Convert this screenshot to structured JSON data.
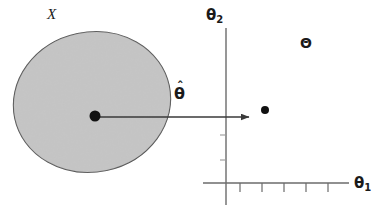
{
  "figure": {
    "kind": "statistical-diagram",
    "background_color": "#ffffff",
    "width": 386,
    "height": 215
  },
  "labels": {
    "sample_space": "X",
    "estimator": "θ",
    "estimator_hat": "ˆ",
    "parameter_space": "Θ",
    "y_axis": "θ",
    "y_axis_subscript": "2",
    "x_axis": "θ",
    "x_axis_subscript": "1"
  },
  "colors": {
    "region_fill": "#c9c9c9",
    "region_stroke": "#4d4d4d",
    "axis": "#6b6b6b",
    "arrow": "#3a3a3a",
    "dot": "#111111",
    "text": "#1a1a1a"
  },
  "shapes": {
    "sample_region": {
      "name": "ellipse",
      "center_x": 92,
      "center_y": 102,
      "radius_x": 79,
      "radius_y": 70,
      "rotation_deg": -12
    },
    "true_parameter_dot": {
      "cx": 95,
      "cy": 116,
      "r": 5.5
    },
    "estimate_dot": {
      "cx": 265,
      "cy": 110,
      "r": 4
    },
    "mapping_arrow": {
      "x1": 98,
      "y1": 117,
      "x2": 250,
      "y2": 117
    }
  },
  "axes": {
    "origin_x": 226,
    "origin_y": 183,
    "y_axis_top": 28,
    "y_axis_bottom": 205,
    "x_axis_left": 203,
    "x_axis_right": 349,
    "x_tick_positions": [
      240,
      262,
      284,
      306,
      328
    ],
    "x_tick_length": 8,
    "y_tick_positions": [
      135,
      160
    ],
    "y_tick_length": 5
  }
}
